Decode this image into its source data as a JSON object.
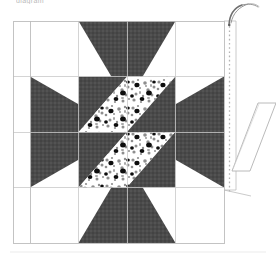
{
  "document": {
    "title": "Eight-Pointed Star Quilt Block Diagram",
    "caption_top": "diagram"
  },
  "figure": {
    "name": "eight-pointed-star-quilt-block",
    "grid": {
      "columns": 4,
      "rows": 4,
      "outer_border": true,
      "left": 13,
      "top": 21,
      "right": 224,
      "bottom": 243,
      "inner_left": 30,
      "line_color": "#c9c9c9",
      "border_color": "#c0c0c0"
    },
    "colors": {
      "dark_fabric": "#4a4a4a",
      "dark_fabric_shade": "#414141",
      "background_fabric": "#ffffff",
      "print_base": "#ffffff",
      "print_speckle": "#8f8f8f",
      "print_dot": "#111111",
      "grid_line": "#c9c9c9",
      "outline": "#9a9a9a",
      "stitch_line": "#b0b0b0",
      "needle": "#6e6e6e"
    },
    "patches": [
      {
        "id": "star-point-top-left",
        "fabric": "dark",
        "shape": "triangle"
      },
      {
        "id": "star-point-top-right",
        "fabric": "dark",
        "shape": "triangle"
      },
      {
        "id": "star-point-right-top",
        "fabric": "dark",
        "shape": "triangle"
      },
      {
        "id": "star-point-right-bottom",
        "fabric": "dark",
        "shape": "triangle"
      },
      {
        "id": "star-point-bottom-right",
        "fabric": "dark",
        "shape": "triangle"
      },
      {
        "id": "star-point-bottom-left",
        "fabric": "dark",
        "shape": "triangle"
      },
      {
        "id": "star-point-left-bottom",
        "fabric": "dark",
        "shape": "triangle"
      },
      {
        "id": "star-point-left-top",
        "fabric": "dark",
        "shape": "triangle"
      },
      {
        "id": "center-square-top-left",
        "fabric": "dark+print",
        "shape": "half-square-triangle"
      },
      {
        "id": "center-square-top-right",
        "fabric": "dark+print",
        "shape": "half-square-triangle"
      },
      {
        "id": "center-square-bottom-left",
        "fabric": "dark+print",
        "shape": "half-square-triangle"
      },
      {
        "id": "center-square-bottom-right",
        "fabric": "dark+print",
        "shape": "half-square-triangle"
      }
    ],
    "annotations": {
      "needle_label": "curved-needle-with-thread",
      "stitch_label": "dashed-basting-line",
      "flap_label": "folded-back-fabric-flap"
    }
  }
}
